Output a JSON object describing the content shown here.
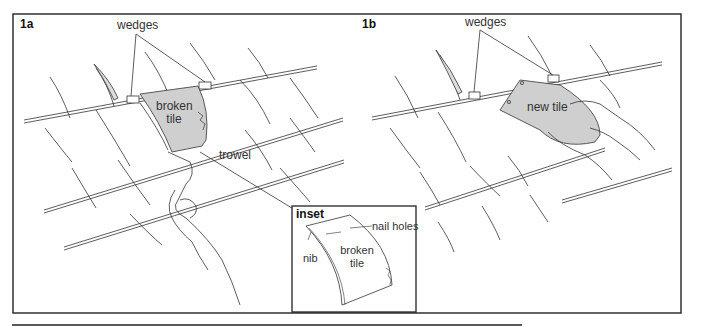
{
  "figure": {
    "panels": [
      {
        "id": "1a",
        "label": "1a",
        "callouts": {
          "wedges": "wedges",
          "broken_tile_line1": "broken",
          "broken_tile_line2": "tile",
          "trowel": "trowel"
        }
      },
      {
        "id": "1b",
        "label": "1b",
        "callouts": {
          "wedges": "wedges",
          "new_tile": "new tile"
        }
      }
    ],
    "inset": {
      "title": "inset",
      "callouts": {
        "nail_holes": "nail holes",
        "nib": "nib",
        "broken_tile_line1": "broken",
        "broken_tile_line2": "tile"
      }
    },
    "colors": {
      "line": "#333333",
      "tile_fill": "#cfcfcf",
      "frame": "#222222",
      "background": "#ffffff"
    }
  }
}
